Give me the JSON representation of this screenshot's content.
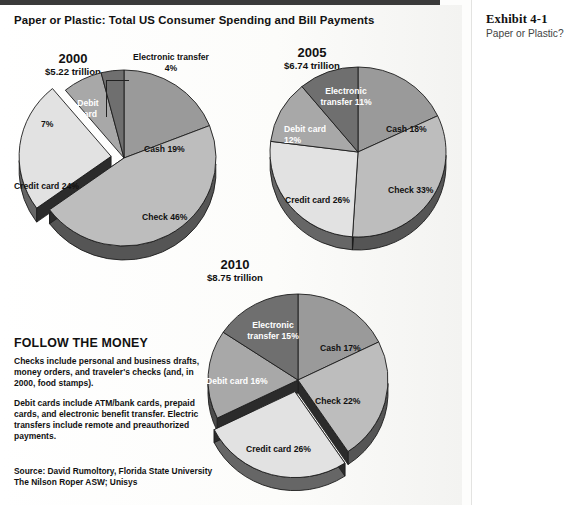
{
  "header": {
    "main_title": "Paper or Plastic: Total US Consumer Spending and Bill Payments",
    "exhibit_number": "Exhibit 4-1",
    "exhibit_subtitle": "Paper or Plastic?"
  },
  "follow_the_money": {
    "heading": "FOLLOW THE MONEY",
    "para1": "Checks include personal and business drafts, money orders, and traveler's checks (and, in 2000, food stamps).",
    "para2": "Debit cards include ATM/bank cards, prepaid cards, and electronic benefit transfer. Electric transfers include remote and preauthorized payments."
  },
  "source": {
    "line1": "Source: David Rumoltory, Florida State University",
    "line2": "The Nilson Roper ASW;  Unisys"
  },
  "colors": {
    "cash": "#9a9a9a",
    "check": "#bdbdbd",
    "credit_card": "#e2e2e2",
    "debit_card": "#a8a8a8",
    "electronic_transfer": "#6f6f6f",
    "wall_dark": "#2b2b2b",
    "outline": "#1c1c1c",
    "page_bg": "#fdfdfc"
  },
  "chart_data": [
    {
      "type": "pie",
      "title": "2000",
      "subtitle": "$5.22 trillion",
      "total_label": "$5.22 trillion",
      "categories": [
        "Cash",
        "Check",
        "Credit card",
        "Debit card",
        "Electronic transfer"
      ],
      "values": [
        19,
        46,
        24,
        7,
        4
      ],
      "labels": [
        "Cash 19%",
        "Check 46%",
        "Credit card 24%",
        "7%",
        "Electronic transfer 4%"
      ],
      "debit_card_name": "Debit card",
      "exploded": [
        "Credit card"
      ],
      "callout": "Electronic transfer 4%",
      "units": "percent"
    },
    {
      "type": "pie",
      "title": "2005",
      "subtitle": "$6.74 trillion",
      "total_label": "$6.74 trillion",
      "categories": [
        "Cash",
        "Check",
        "Credit card",
        "Debit card",
        "Electronic transfer"
      ],
      "values": [
        18,
        33,
        26,
        12,
        11
      ],
      "labels": [
        "Cash 18%",
        "Check 33%",
        "Credit card 26%",
        "Debit card 12%",
        "Electronic transfer 11%"
      ],
      "exploded": [],
      "units": "percent"
    },
    {
      "type": "pie",
      "title": "2010",
      "subtitle": "$8.75 trillion",
      "total_label": "$8.75 trillion",
      "categories": [
        "Cash",
        "Check",
        "Credit card",
        "Debit card",
        "Electronic transfer"
      ],
      "values": [
        17,
        22,
        26,
        16,
        15
      ],
      "labels": [
        "Cash 17%",
        "Check 22%",
        "Credit card 26%",
        "Debit card 16%",
        "Electronic transfer 15%"
      ],
      "exploded": [
        "Credit card"
      ],
      "units": "percent"
    }
  ]
}
